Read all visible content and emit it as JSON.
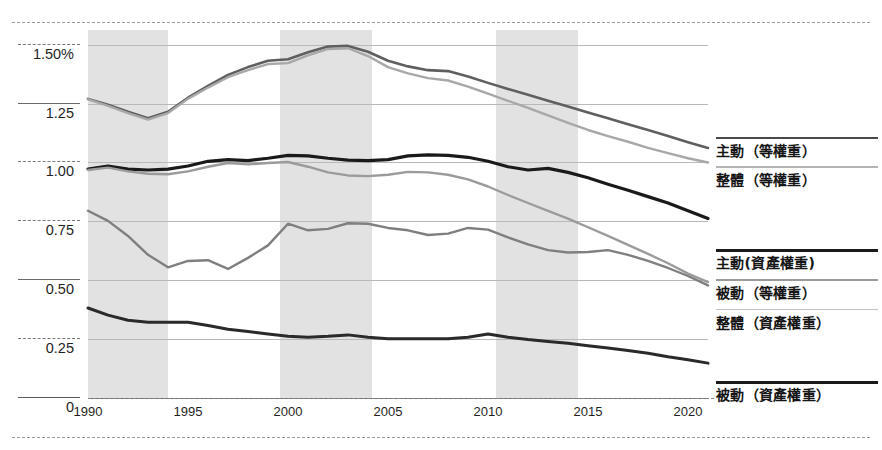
{
  "chart_data": {
    "type": "line",
    "title": "",
    "xlabel": "",
    "ylabel": "",
    "x": [
      1990,
      1991,
      1992,
      1993,
      1994,
      1995,
      1996,
      1997,
      1998,
      1999,
      2000,
      2001,
      2002,
      2003,
      2004,
      2005,
      2006,
      2007,
      2008,
      2009,
      2010,
      2011,
      2012,
      2013,
      2014,
      2015,
      2016,
      2017,
      2018,
      2019,
      2020,
      2021
    ],
    "xlim": [
      1990,
      2021
    ],
    "ylim": [
      0,
      1.5625
    ],
    "yticks": [
      0,
      0.25,
      0.5,
      0.75,
      1.0,
      1.25,
      1.5
    ],
    "ytick_labels": [
      "0",
      "0.25",
      "0.50",
      "0.75",
      "1.00",
      "1.25",
      "1.50%"
    ],
    "xticks": [
      1990,
      1995,
      2000,
      2005,
      2010,
      2015,
      2020
    ],
    "xtick_labels": [
      "1990",
      "1995",
      "2000",
      "2005",
      "2010",
      "2015",
      "2020"
    ],
    "grid": true,
    "legend_position": "right",
    "shaded_bands": [
      {
        "start": 1990.0,
        "end": 1994.0
      },
      {
        "start": 1999.6,
        "end": 2004.2
      },
      {
        "start": 2010.4,
        "end": 2014.5
      }
    ],
    "shaded_band_color": "#e2e2e2",
    "series": [
      {
        "name": "主動（等權重）",
        "color": "#5f5f5f",
        "width": 2.6,
        "values": [
          1.27,
          1.245,
          1.215,
          1.188,
          1.215,
          1.275,
          1.325,
          1.372,
          1.405,
          1.432,
          1.438,
          1.468,
          1.492,
          1.495,
          1.47,
          1.432,
          1.408,
          1.392,
          1.388,
          1.365,
          1.338,
          1.312,
          1.288,
          1.262,
          1.238,
          1.212,
          1.188,
          1.162,
          1.138,
          1.112,
          1.086,
          1.062
        ]
      },
      {
        "name": "整體（等權重）",
        "color": "#a8a8a8",
        "width": 2.4,
        "values": [
          1.268,
          1.24,
          1.21,
          1.182,
          1.21,
          1.27,
          1.318,
          1.362,
          1.392,
          1.418,
          1.422,
          1.455,
          1.482,
          1.485,
          1.452,
          1.405,
          1.378,
          1.358,
          1.348,
          1.322,
          1.292,
          1.262,
          1.232,
          1.2,
          1.168,
          1.138,
          1.112,
          1.088,
          1.062,
          1.04,
          1.018,
          1.0
        ]
      },
      {
        "name": "主動(資產權重)",
        "color": "#1a1a1a",
        "width": 3.2,
        "values": [
          0.972,
          0.985,
          0.972,
          0.968,
          0.972,
          0.985,
          1.005,
          1.012,
          1.008,
          1.018,
          1.03,
          1.028,
          1.018,
          1.01,
          1.008,
          1.012,
          1.028,
          1.032,
          1.03,
          1.022,
          1.005,
          0.982,
          0.968,
          0.975,
          0.958,
          0.935,
          0.908,
          0.882,
          0.855,
          0.828,
          0.795,
          0.762
        ]
      },
      {
        "name": "被動（等權重）",
        "color": "#9b9b9b",
        "width": 2.4,
        "values": [
          0.968,
          0.978,
          0.962,
          0.952,
          0.95,
          0.962,
          0.982,
          0.998,
          0.992,
          0.998,
          1.002,
          0.982,
          0.958,
          0.945,
          0.942,
          0.948,
          0.96,
          0.958,
          0.948,
          0.928,
          0.898,
          0.862,
          0.828,
          0.795,
          0.762,
          0.725,
          0.688,
          0.65,
          0.612,
          0.572,
          0.528,
          0.492
        ]
      },
      {
        "name": "整體（資產權重）",
        "color": "#7f7f7f",
        "width": 2.4,
        "values": [
          0.795,
          0.752,
          0.688,
          0.608,
          0.555,
          0.582,
          0.585,
          0.548,
          0.595,
          0.648,
          0.74,
          0.712,
          0.718,
          0.742,
          0.74,
          0.722,
          0.712,
          0.692,
          0.698,
          0.722,
          0.715,
          0.682,
          0.652,
          0.628,
          0.618,
          0.62,
          0.628,
          0.608,
          0.582,
          0.552,
          0.518,
          0.478
        ]
      },
      {
        "name": "被動（資產權重）",
        "color": "#2a2a2a",
        "width": 3.0,
        "values": [
          0.382,
          0.352,
          0.33,
          0.322,
          0.322,
          0.322,
          0.308,
          0.292,
          0.282,
          0.272,
          0.262,
          0.258,
          0.262,
          0.268,
          0.258,
          0.252,
          0.252,
          0.252,
          0.252,
          0.258,
          0.272,
          0.258,
          0.248,
          0.24,
          0.232,
          0.222,
          0.212,
          0.202,
          0.19,
          0.175,
          0.162,
          0.148
        ]
      }
    ]
  },
  "legend": {
    "items": [
      {
        "label": "主動（等權重）",
        "color": "#4a4a4a",
        "top": 137,
        "weight": 2.6
      },
      {
        "label": "整體（等權重）",
        "color": "#b5b5b5",
        "top": 166,
        "weight": 2.0
      },
      {
        "label": "主動(資產權重)",
        "color": "#1a1a1a",
        "top": 249,
        "weight": 3.0
      },
      {
        "label": "被動（等權重）",
        "color": "#9b9b9b",
        "top": 279,
        "weight": 2.2
      },
      {
        "label": "整體（資產權重）",
        "color": "#c2c2c2",
        "top": 309,
        "weight": 1.8
      },
      {
        "label": "被動（資產權重）",
        "color": "#1a1a1a",
        "top": 381,
        "weight": 3.0
      }
    ]
  },
  "frame": {
    "top_rule": 22,
    "bottom_rule": 437
  }
}
